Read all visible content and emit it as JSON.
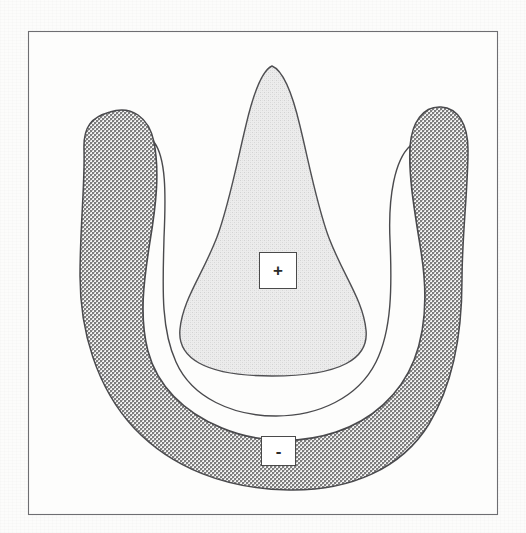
{
  "figure": {
    "frame": {
      "name": "figure-border",
      "stroke_color": "#6e6e72",
      "fill_color": "#fdfdfc",
      "x": 28,
      "y": 31,
      "width": 470,
      "height": 484
    },
    "background_color": "#fcfcfb",
    "regions": [
      {
        "id": "inner-lobe",
        "name": "teardrop-region",
        "polarity": "+",
        "fill_color": "#e6e6e6",
        "stroke_color": "#4f4f52",
        "texture": "fine-stipple",
        "apex_x": 272,
        "apex_y": 66,
        "bottom_y": 376,
        "max_width": 196
      },
      {
        "id": "outer-band",
        "name": "horseshoe-region",
        "polarity": "-",
        "fill_color": "#b9b9b9",
        "stroke_color": "#4a4a4d",
        "texture": "cross-hatch-checker",
        "left_tip_x": 110,
        "left_tip_y": 112,
        "right_tip_x": 404,
        "right_tip_y": 108,
        "bottom_y": 489
      }
    ],
    "labels": [
      {
        "id": "label-plus",
        "name": "polarity-label-positive",
        "text": "+",
        "x": 259,
        "y": 252,
        "width": 38,
        "height": 37,
        "box_fill": "#ffffff",
        "box_stroke": "#4a4a4a"
      },
      {
        "id": "label-minus",
        "name": "polarity-label-negative",
        "text": "-",
        "x": 261,
        "y": 436,
        "width": 35,
        "height": 30,
        "box_fill": "#ffffff",
        "box_stroke": "#4a4a4a"
      }
    ]
  }
}
